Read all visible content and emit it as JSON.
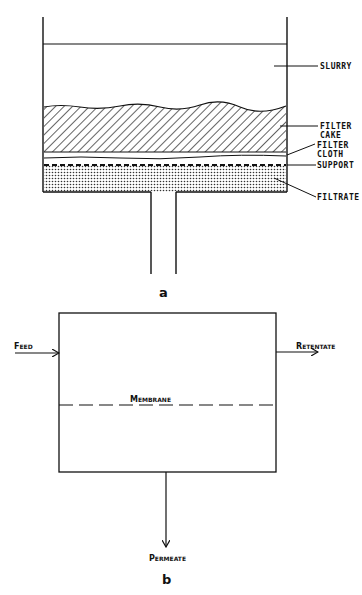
{
  "figure_a": {
    "caption": "a",
    "labels": {
      "slurry": "SLURRY",
      "filter_cake_1": "FILTER",
      "filter_cake_2": "CAKE",
      "filter_cloth_1": "FILTER",
      "filter_cloth_2": "CLOTH",
      "support": "SUPPORT",
      "filtrate": "FILTRATE"
    }
  },
  "figure_b": {
    "caption": "b",
    "labels": {
      "feed": "Feed",
      "retentate": "Retentate",
      "membrane": "Membrane",
      "permeate": "Permeate"
    }
  },
  "colors": {
    "line": "#111111",
    "background": "#ffffff"
  }
}
